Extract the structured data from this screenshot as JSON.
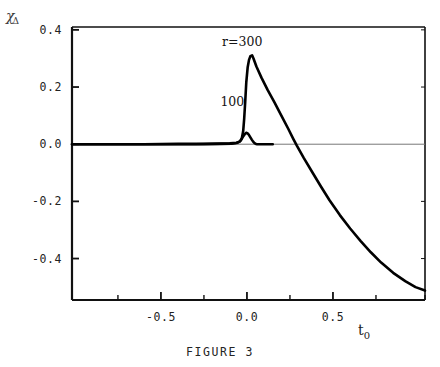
{
  "figure": {
    "caption": "FIGURE 3",
    "ylabel_symbol": "χ",
    "ylabel_subscript": "Δ",
    "xlabel_symbol": "t",
    "xlabel_subscript": "0"
  },
  "chart_data": {
    "type": "line",
    "title": "",
    "xlabel": "t_0",
    "ylabel": "chi_Delta",
    "xlim": [
      -1.017,
      1.035
    ],
    "ylim": [
      -0.545,
      0.41
    ],
    "xticks": [
      -0.5,
      0.0,
      0.5
    ],
    "xtick_labels": [
      "-0.5",
      "0.0",
      "0.5"
    ],
    "yticks": [
      0.4,
      0.2,
      0.0,
      -0.2,
      -0.4
    ],
    "ytick_labels": [
      "0.4",
      "0.2",
      "0.0",
      "-0.2",
      "-0.4"
    ],
    "minor_xticks": [
      -1.017,
      -0.75,
      -0.25,
      0.25,
      0.75,
      1.035
    ],
    "grid": false,
    "legend_position": "in-plot-annotations",
    "zero_line": true,
    "annotations": [
      {
        "text": "r=300",
        "x": 0.03,
        "y": 0.355
      },
      {
        "text": "100",
        "x": 0.02,
        "y": 0.145
      }
    ],
    "series": [
      {
        "name": "r=300",
        "color": "#000000",
        "points": [
          [
            -1.017,
            0.0
          ],
          [
            -0.8,
            0.0
          ],
          [
            -0.6,
            0.0
          ],
          [
            -0.4,
            0.001
          ],
          [
            -0.25,
            0.001
          ],
          [
            -0.15,
            0.002
          ],
          [
            -0.1,
            0.003
          ],
          [
            -0.06,
            0.005
          ],
          [
            -0.04,
            0.01
          ],
          [
            -0.03,
            0.02
          ],
          [
            -0.022,
            0.045
          ],
          [
            -0.016,
            0.09
          ],
          [
            -0.01,
            0.15
          ],
          [
            -0.004,
            0.215
          ],
          [
            0.004,
            0.268
          ],
          [
            0.012,
            0.295
          ],
          [
            0.02,
            0.308
          ],
          [
            0.03,
            0.311
          ],
          [
            0.038,
            0.3
          ],
          [
            0.055,
            0.272
          ],
          [
            0.085,
            0.232
          ],
          [
            0.12,
            0.19
          ],
          [
            0.16,
            0.146
          ],
          [
            0.2,
            0.1
          ],
          [
            0.24,
            0.054
          ],
          [
            0.27,
            0.018
          ],
          [
            0.29,
            -0.005
          ],
          [
            0.33,
            -0.048
          ],
          [
            0.38,
            -0.098
          ],
          [
            0.43,
            -0.148
          ],
          [
            0.48,
            -0.196
          ],
          [
            0.54,
            -0.248
          ],
          [
            0.6,
            -0.295
          ],
          [
            0.66,
            -0.338
          ],
          [
            0.72,
            -0.378
          ],
          [
            0.78,
            -0.414
          ],
          [
            0.85,
            -0.45
          ],
          [
            0.92,
            -0.479
          ],
          [
            0.98,
            -0.5
          ],
          [
            1.035,
            -0.512
          ]
        ]
      },
      {
        "name": "100",
        "color": "#000000",
        "points": [
          [
            -1.017,
            0.0
          ],
          [
            -0.6,
            0.0
          ],
          [
            -0.3,
            0.0
          ],
          [
            -0.15,
            0.001
          ],
          [
            -0.09,
            0.002
          ],
          [
            -0.06,
            0.004
          ],
          [
            -0.045,
            0.008
          ],
          [
            -0.035,
            0.014
          ],
          [
            -0.028,
            0.021
          ],
          [
            -0.02,
            0.029
          ],
          [
            -0.012,
            0.036
          ],
          [
            -0.004,
            0.04
          ],
          [
            0.004,
            0.038
          ],
          [
            0.012,
            0.032
          ],
          [
            0.02,
            0.024
          ],
          [
            0.028,
            0.016
          ],
          [
            0.036,
            0.009
          ],
          [
            0.044,
            0.004
          ],
          [
            0.052,
            0.001
          ],
          [
            0.06,
            0.0
          ],
          [
            0.09,
            0.0
          ],
          [
            0.15,
            0.0
          ]
        ]
      }
    ]
  }
}
